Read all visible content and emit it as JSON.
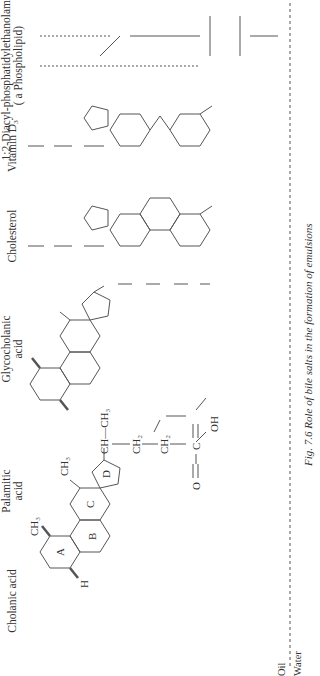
{
  "figure": {
    "caption": "Fig. 7.6  Role of bile salts in the formation of emulsions",
    "oil_label": "Oil",
    "water_label": "Water",
    "compounds": [
      {
        "id": "cholanic",
        "label": "Cholanic acid"
      },
      {
        "id": "palmitic",
        "label_line1": "Palamitic",
        "label_line2": "acid"
      },
      {
        "id": "glycocholanic",
        "label_line1": "Glycocholanic",
        "label_line2": "acid"
      },
      {
        "id": "cholesterol",
        "label": "Cholesterol"
      },
      {
        "id": "vitamin_d3",
        "label": "Vitamin D₃"
      },
      {
        "id": "phospholipid",
        "label_line1": "1:2-Diacyl-phosphatidylethanolamine",
        "label_line2": "( a Phospholipid)"
      }
    ],
    "ring_labels": [
      "A",
      "B",
      "C",
      "D"
    ],
    "groups": {
      "ch3": "CH₃",
      "ch2": "CH₂",
      "h2c": "H₂C",
      "h3c": "H₃C",
      "ch": "CH",
      "oh": "OH",
      "o": "O",
      "c": "C",
      "nh": "NH",
      "h": "H",
      "p": "P",
      "nh3": "NH₃⁺",
      "ch2_14": "(CH₂)₁₄",
      "o_minus": "O⁻",
      "ch_ch3": "CH—CH₃",
      "ch3_ch": "CH₃—CH"
    }
  }
}
